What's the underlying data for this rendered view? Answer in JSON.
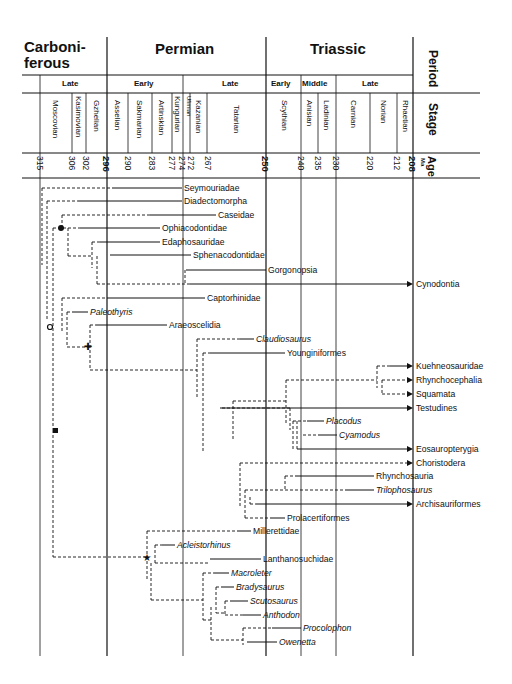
{
  "header": {
    "periods": [
      {
        "label": "Carboni-",
        "label2": "ferous",
        "x1": 40,
        "x2": 107
      },
      {
        "label": "Permian",
        "x1": 107,
        "x2": 266
      },
      {
        "label": "Triassic",
        "x1": 266,
        "x2": 413
      }
    ],
    "period_row_label": "Period",
    "subperiods": [
      {
        "label": "Late",
        "x1": 40,
        "x2": 107
      },
      {
        "label": "Early",
        "x1": 107,
        "x2": 183
      },
      {
        "label": "Late",
        "x1": 183,
        "x2": 266
      },
      {
        "label": "Early",
        "x1": 266,
        "x2": 301
      },
      {
        "label": "Middle",
        "x1": 301,
        "x2": 336
      },
      {
        "label": "Late",
        "x1": 336,
        "x2": 413
      }
    ],
    "stage_row_label": "Stage",
    "stages": [
      {
        "label": "Moscovian",
        "x1": 40,
        "x2": 72
      },
      {
        "label": "Kasimovian",
        "x1": 72,
        "x2": 86
      },
      {
        "label": "Gzhelian",
        "x1": 86,
        "x2": 107
      },
      {
        "label": "Asselian",
        "x1": 107,
        "x2": 128
      },
      {
        "label": "Sakmarian",
        "x1": 128,
        "x2": 152
      },
      {
        "label": "Artinskian",
        "x1": 152,
        "x2": 172
      },
      {
        "label": "Kungurian",
        "x1": 172,
        "x2": 183
      },
      {
        "label": "Ufimian",
        "x1": 183,
        "x2": 190
      },
      {
        "label": "Kazanian",
        "x1": 190,
        "x2": 207
      },
      {
        "label": "Tatarian",
        "x1": 207,
        "x2": 266
      },
      {
        "label": "Scythian",
        "x1": 266,
        "x2": 301
      },
      {
        "label": "Anisian",
        "x1": 301,
        "x2": 318
      },
      {
        "label": "Ladinian",
        "x1": 318,
        "x2": 336
      },
      {
        "label": "Carnian",
        "x1": 336,
        "x2": 370
      },
      {
        "label": "Norian",
        "x1": 370,
        "x2": 397
      },
      {
        "label": "Rhaetian",
        "x1": 397,
        "x2": 413
      }
    ],
    "age_row_label": "Age",
    "age_unit": "Ma",
    "ages": [
      {
        "label": "315",
        "x": 40,
        "bold": false
      },
      {
        "label": "306",
        "x": 72,
        "bold": false
      },
      {
        "label": "302",
        "x": 86,
        "bold": false
      },
      {
        "label": "296",
        "x": 107,
        "bold": true
      },
      {
        "label": "290",
        "x": 128,
        "bold": false
      },
      {
        "label": "283",
        "x": 152,
        "bold": false
      },
      {
        "label": "277",
        "x": 172,
        "bold": false
      },
      {
        "label": "274",
        "x": 183,
        "bold": false
      },
      {
        "label": "272",
        "x": 190,
        "bold": false
      },
      {
        "label": "267",
        "x": 207,
        "bold": false
      },
      {
        "label": "250",
        "x": 266,
        "bold": true
      },
      {
        "label": "240",
        "x": 301,
        "bold": false
      },
      {
        "label": "235",
        "x": 318,
        "bold": false
      },
      {
        "label": "230",
        "x": 336,
        "bold": false
      },
      {
        "label": "220",
        "x": 370,
        "bold": false
      },
      {
        "label": "212",
        "x": 397,
        "bold": false
      },
      {
        "label": "208",
        "x": 413,
        "bold": true
      }
    ]
  },
  "taxa": [
    {
      "name": "Seymouriadae",
      "x": 184,
      "y": 188,
      "italic": false
    },
    {
      "name": "Diadectomorpha",
      "x": 184,
      "y": 201,
      "italic": false
    },
    {
      "name": "Caseidae",
      "x": 218,
      "y": 215,
      "italic": false
    },
    {
      "name": "Ophiacodontidae",
      "x": 162,
      "y": 228,
      "italic": false
    },
    {
      "name": "Edaphosauridae",
      "x": 162,
      "y": 242,
      "italic": false
    },
    {
      "name": "Sphenacodontidae",
      "x": 193,
      "y": 255,
      "italic": false
    },
    {
      "name": "Gorgonopsia",
      "x": 268,
      "y": 270,
      "italic": false
    },
    {
      "name": "Cynodontia",
      "x": 416,
      "y": 284,
      "italic": false
    },
    {
      "name": "Captorhinidae",
      "x": 207,
      "y": 298,
      "italic": false
    },
    {
      "name": "Paleothyris",
      "x": 90,
      "y": 312,
      "italic": true
    },
    {
      "name": "Araeoscelidia",
      "x": 169,
      "y": 325,
      "italic": false
    },
    {
      "name": "Claudiosaurus",
      "x": 256,
      "y": 339,
      "italic": true
    },
    {
      "name": "Younginiformes",
      "x": 287,
      "y": 353,
      "italic": false
    },
    {
      "name": "Kuehneosauridae",
      "x": 416,
      "y": 366,
      "italic": false
    },
    {
      "name": "Rhynchocephalia",
      "x": 416,
      "y": 380,
      "italic": false
    },
    {
      "name": "Squamata",
      "x": 416,
      "y": 394,
      "italic": false
    },
    {
      "name": "Testudines",
      "x": 416,
      "y": 408,
      "italic": false
    },
    {
      "name": "Placodus",
      "x": 326,
      "y": 421,
      "italic": true
    },
    {
      "name": "Cyamodus",
      "x": 339,
      "y": 435,
      "italic": true
    },
    {
      "name": "Eosauropterygia",
      "x": 416,
      "y": 449,
      "italic": false
    },
    {
      "name": "Choristodera",
      "x": 416,
      "y": 463,
      "italic": false
    },
    {
      "name": "Rhynchosauria",
      "x": 376,
      "y": 476,
      "italic": false
    },
    {
      "name": "Trilophosaurus",
      "x": 376,
      "y": 490,
      "italic": true
    },
    {
      "name": "Archisauriformes",
      "x": 416,
      "y": 504,
      "italic": false
    },
    {
      "name": "Prolacertiformes",
      "x": 287,
      "y": 518,
      "italic": false
    },
    {
      "name": "Millerettidae",
      "x": 253,
      "y": 531,
      "italic": false
    },
    {
      "name": "Acleistorhinus",
      "x": 177,
      "y": 545,
      "italic": true
    },
    {
      "name": "Lanthanosuchidae",
      "x": 263,
      "y": 559,
      "italic": false
    },
    {
      "name": "Macroleter",
      "x": 231,
      "y": 573,
      "italic": true
    },
    {
      "name": "Bradysaurus",
      "x": 236,
      "y": 587,
      "italic": true
    },
    {
      "name": "Scutosaurus",
      "x": 250,
      "y": 601,
      "italic": true
    },
    {
      "name": "Anthodon",
      "x": 263,
      "y": 615,
      "italic": true
    },
    {
      "name": "Procolophon",
      "x": 303,
      "y": 628,
      "italic": true
    },
    {
      "name": "Owenetta",
      "x": 279,
      "y": 642,
      "italic": true
    }
  ]
}
